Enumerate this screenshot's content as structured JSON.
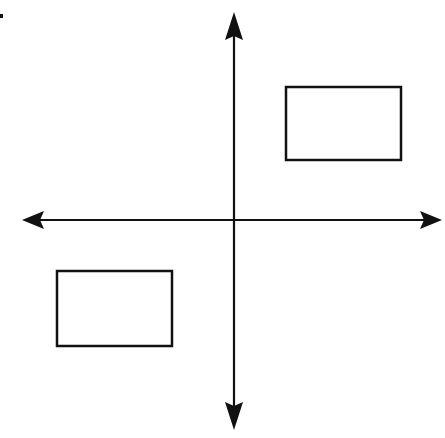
{
  "diagram": {
    "origin": {
      "x": 234,
      "y": 220
    },
    "colors": {
      "stroke": "#111111",
      "background": "#ffffff"
    },
    "axes": {
      "x_axis": {
        "x1": 22,
        "x2": 442,
        "y": 220,
        "arrows": [
          "left",
          "right"
        ]
      },
      "y_axis": {
        "x": 234,
        "y1": 12,
        "y2": 430,
        "arrows": [
          "up",
          "down"
        ]
      }
    },
    "shapes": [
      {
        "name": "rectangle-quadrant-1",
        "quadrant": "I",
        "x": 286,
        "y": 87,
        "width": 115,
        "height": 73
      },
      {
        "name": "rectangle-quadrant-3",
        "quadrant": "III",
        "x": 57,
        "y": 271,
        "width": 115,
        "height": 75
      }
    ],
    "corner_mark": {
      "x": 0,
      "y": 14,
      "width": 3,
      "height": 4
    }
  }
}
